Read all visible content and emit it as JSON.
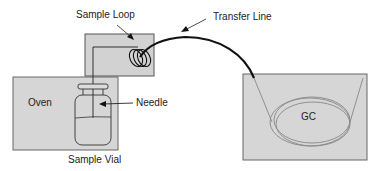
{
  "diagram": {
    "labels": {
      "sample_loop": "Sample Loop",
      "transfer_line": "Transfer Line",
      "oven": "Oven",
      "needle": "Needle",
      "sample_vial": "Sample Vial",
      "gc": "GC"
    },
    "colors": {
      "box_fill": "#d4d4d4",
      "box_stroke": "#555555",
      "line": "#111111",
      "column": "#888888"
    }
  }
}
